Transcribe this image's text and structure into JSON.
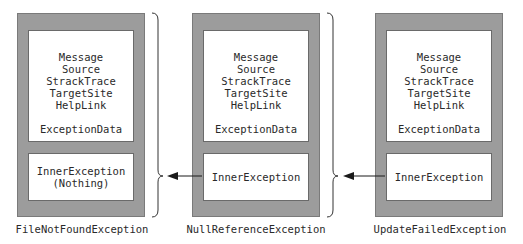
{
  "diagram": {
    "exceptions": [
      {
        "name": "FileNotFoundException",
        "properties": [
          "Message",
          "Source",
          "StrackTrace",
          "TargetSite",
          "HelpLink"
        ],
        "data_label": "ExceptionData",
        "inner_label": "InnerException",
        "inner_value": "(Nothing)"
      },
      {
        "name": "NullReferenceException",
        "properties": [
          "Message",
          "Source",
          "StrackTrace",
          "TargetSite",
          "HelpLink"
        ],
        "data_label": "ExceptionData",
        "inner_label": "InnerException"
      },
      {
        "name": "UpdateFailedException",
        "properties": [
          "Message",
          "Source",
          "StrackTrace",
          "TargetSite",
          "HelpLink"
        ],
        "data_label": "ExceptionData",
        "inner_label": "InnerException"
      }
    ],
    "colors": {
      "outer_fill": "#9c9c9c",
      "inner_fill": "#ffffff",
      "line": "#1a1a1a"
    }
  }
}
